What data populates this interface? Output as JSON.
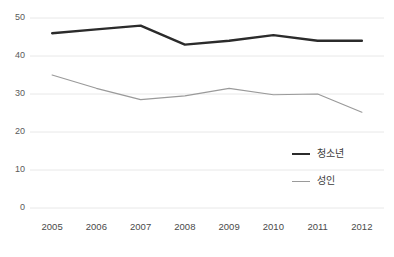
{
  "chart_data": {
    "type": "line",
    "title": "",
    "subtitle": "",
    "xlabel": "",
    "ylabel": "",
    "categories": [
      "2005",
      "2006",
      "2007",
      "2008",
      "2009",
      "2010",
      "2011",
      "2012"
    ],
    "series": [
      {
        "name": "청소년",
        "color": "#2b2b2b",
        "line_width": 2.4,
        "values": [
          46.0,
          47.0,
          48.0,
          43.0,
          44.0,
          45.5,
          44.0,
          44.0
        ]
      },
      {
        "name": "성인",
        "color": "#9a9a9a",
        "line_width": 1.2,
        "values": [
          35.0,
          31.5,
          28.5,
          29.5,
          31.5,
          29.8,
          30.0,
          25.2
        ]
      }
    ],
    "ylim": [
      0,
      50
    ],
    "yticks": [
      0,
      10,
      20,
      30,
      40,
      50
    ],
    "ytick_labels": [
      "0",
      "10",
      "20",
      "30",
      "40",
      "50"
    ],
    "grid": true,
    "grid_color": "#e8e8e8",
    "legend_position": "inside-bottom-right",
    "legend": [
      "청소년",
      "성인"
    ],
    "background": "#ffffff"
  },
  "axis": {
    "y_labels": [
      "50",
      "40",
      "30",
      "20",
      "10",
      "0"
    ],
    "x_labels": [
      "2005",
      "2006",
      "2007",
      "2008",
      "2009",
      "2010",
      "2011",
      "2012"
    ]
  },
  "legend": {
    "items": [
      {
        "label": "청소년"
      },
      {
        "label": "성인"
      }
    ]
  }
}
